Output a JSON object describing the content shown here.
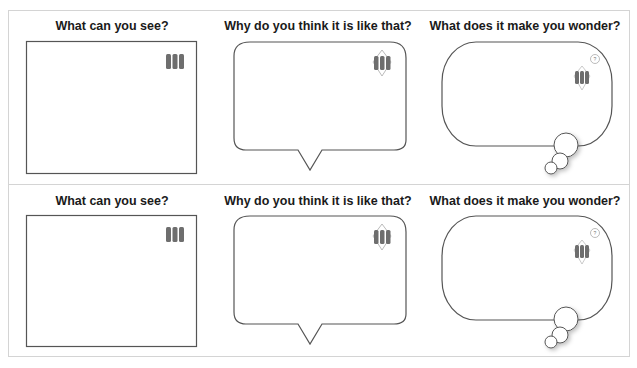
{
  "worksheet": {
    "rows": [
      {
        "panels": [
          {
            "title": "What can you see?",
            "icon": "microscope-slide-icon",
            "shape": "rectangle"
          },
          {
            "title": "Why do you think it is like that?",
            "icon": "slide-with-diamond-icon",
            "shape": "speech-bubble"
          },
          {
            "title": "What does it make you wonder?",
            "icon": "slide-with-question-icon",
            "shape": "thought-bubble"
          }
        ]
      },
      {
        "panels": [
          {
            "title": "What can you see?",
            "icon": "microscope-slide-icon",
            "shape": "rectangle"
          },
          {
            "title": "Why do you think it is like that?",
            "icon": "slide-with-diamond-icon",
            "shape": "speech-bubble"
          },
          {
            "title": "What does it make you wonder?",
            "icon": "slide-with-question-icon",
            "shape": "thought-bubble"
          }
        ]
      }
    ],
    "colors": {
      "outline": "#555555",
      "frame": "#d4d4d4",
      "icon_bar": "#6e6e6e",
      "title_text": "#1a1a1a"
    }
  }
}
